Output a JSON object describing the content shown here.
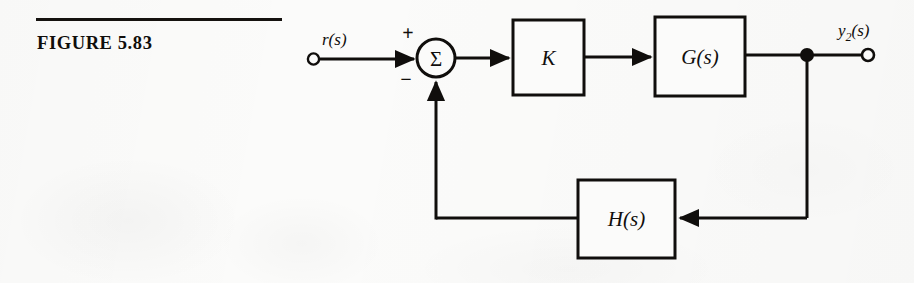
{
  "caption": {
    "figure_label": "FIGURE 5.83",
    "rule_color": "#15120f"
  },
  "diagram": {
    "type": "control-system-block-diagram",
    "line_color": "#100e0c",
    "background": "#fbfbfa",
    "input_terminal": {
      "label": "r(s)",
      "marker": "open-circle"
    },
    "summing_junction": {
      "symbol": "Σ",
      "plus_sign": "+",
      "minus_sign": "−",
      "plus_input": "r(s)",
      "minus_input": "H(s)"
    },
    "blocks": [
      {
        "id": "gain",
        "label": "K"
      },
      {
        "id": "plant",
        "label": "G(s)"
      },
      {
        "id": "feedback",
        "label": "H(s)"
      }
    ],
    "output_terminal": {
      "label_main": "y",
      "label_sub": "2",
      "label_tail": "(s)",
      "label": "y2(s)",
      "marker": "open-circle",
      "takeoff_point": "filled-dot"
    }
  }
}
